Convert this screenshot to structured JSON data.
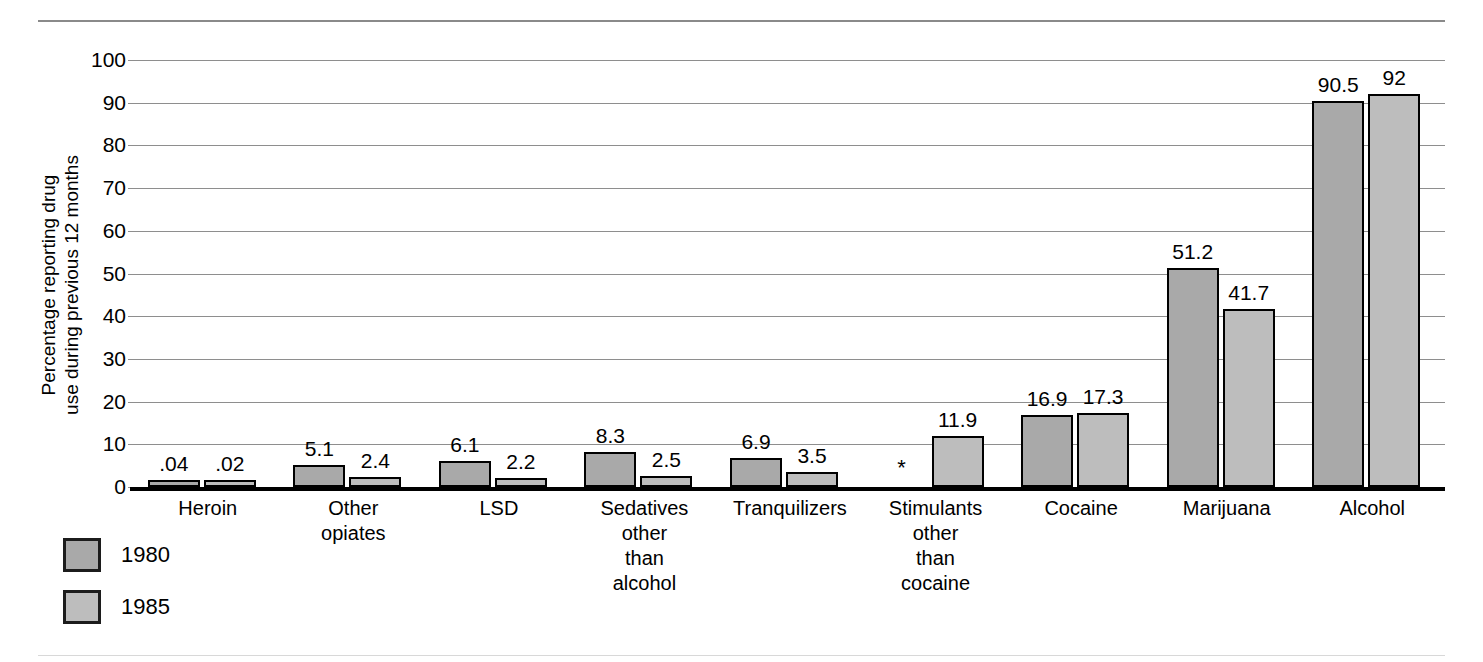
{
  "chart_data": {
    "type": "bar",
    "title": "",
    "xlabel": "",
    "ylabel": "Percentage reporting drug\nuse during previous 12 months",
    "ylim": [
      0,
      100
    ],
    "ytick_step": 10,
    "yticks": [
      "0",
      "10",
      "20",
      "30",
      "40",
      "50",
      "60",
      "70",
      "80",
      "90",
      "100"
    ],
    "grid": true,
    "legend_position": "bottom-left",
    "categories": [
      "Heroin",
      "Other\nopiates",
      "LSD",
      "Sedatives\nother\nthan\nalcohol",
      "Tranquilizers",
      "Stimulants\nother\nthan\ncocaine",
      "Cocaine",
      "Marijuana",
      "Alcohol"
    ],
    "series": [
      {
        "name": "1980",
        "color": "#a9a9a9",
        "values": [
          0.04,
          5.1,
          6.1,
          8.3,
          6.9,
          null,
          16.9,
          51.2,
          90.5
        ],
        "labels": [
          ".04",
          "5.1",
          "6.1",
          "8.3",
          "6.9",
          "*",
          "16.9",
          "51.2",
          "90.5"
        ]
      },
      {
        "name": "1985",
        "color": "#bdbdbd",
        "values": [
          0.02,
          2.4,
          2.2,
          2.5,
          3.5,
          11.9,
          17.3,
          41.7,
          92
        ],
        "labels": [
          ".02",
          "2.4",
          "2.2",
          "2.5",
          "3.5",
          "11.9",
          "17.3",
          "41.7",
          "92"
        ]
      }
    ],
    "missing_marker": "*"
  },
  "legend": {
    "items": [
      {
        "label": "1980",
        "color": "#a9a9a9"
      },
      {
        "label": "1985",
        "color": "#bdbdbd"
      }
    ]
  }
}
